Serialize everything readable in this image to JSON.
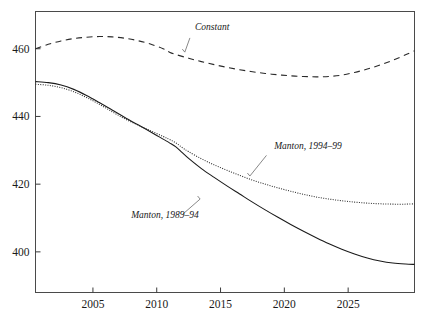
{
  "figure": {
    "top_fragment_text": "",
    "background_color": "#ffffff",
    "frame_color": "#4a4a4a"
  },
  "chart_data": {
    "type": "line",
    "title": "",
    "subtitle": "",
    "xlabel": "",
    "ylabel": "",
    "xlim": [
      2000.5,
      2030.2
    ],
    "ylim": [
      388,
      471
    ],
    "grid": false,
    "legend_position": "inline-annotations",
    "x_ticks": [
      2005,
      2010,
      2015,
      2020,
      2025
    ],
    "x_tick_labels": [
      "2005",
      "2010",
      "2015",
      "2020",
      "2025"
    ],
    "y_ticks": [
      400,
      420,
      440,
      460
    ],
    "y_tick_labels": [
      "400",
      "420",
      "440",
      "460"
    ],
    "series": [
      {
        "name": "Constant",
        "style": "dashed",
        "color": "#2a2a2a",
        "label": "Constant",
        "label_x": 2013.0,
        "label_y": 465.5,
        "leader_from": [
          2012.6,
          463.2
        ],
        "leader_to": [
          2012.2,
          459.0
        ],
        "x": [
          2000.5,
          2001.5,
          2002.5,
          2003.5,
          2004.5,
          2005.5,
          2006.5,
          2007.5,
          2008.5,
          2009.5,
          2010.5,
          2011.0,
          2011.5,
          2012.5,
          2013.5,
          2014.5,
          2015.5,
          2016.5,
          2017.5,
          2018.5,
          2019.5,
          2020.5,
          2021.5,
          2022.5,
          2023.5,
          2024.5,
          2025.5,
          2026.5,
          2027.5,
          2028.5,
          2029.5,
          2030.2
        ],
        "y": [
          460.0,
          461.3,
          462.3,
          463.0,
          463.4,
          463.6,
          463.5,
          463.1,
          462.4,
          461.4,
          460.0,
          459.0,
          458.3,
          457.2,
          456.2,
          455.3,
          454.5,
          453.8,
          453.2,
          452.7,
          452.3,
          452.0,
          451.8,
          451.7,
          451.8,
          452.2,
          453.0,
          454.0,
          455.2,
          456.6,
          458.2,
          459.4
        ]
      },
      {
        "name": "Manton, 1994-99",
        "style": "dotted",
        "color": "#2a2a2a",
        "label": "Manton, 1994–99",
        "label_x": 2019.2,
        "label_y": 430.5,
        "leader_from": [
          2018.6,
          428.5
        ],
        "leader_to": [
          2017.3,
          422.4
        ],
        "x": [
          2000.5,
          2001.5,
          2002.5,
          2003.5,
          2004.5,
          2005.5,
          2006.5,
          2007.5,
          2008.5,
          2009.5,
          2010.5,
          2011.0,
          2011.5,
          2012.0,
          2012.5,
          2013.5,
          2014.5,
          2015.5,
          2016.5,
          2017.5,
          2018.5,
          2019.5,
          2020.5,
          2021.5,
          2022.5,
          2023.5,
          2024.5,
          2025.5,
          2026.5,
          2027.5,
          2028.5,
          2029.5,
          2030.2
        ],
        "y": [
          449.5,
          449.2,
          448.5,
          447.3,
          445.6,
          443.6,
          441.4,
          439.3,
          437.5,
          435.8,
          434.1,
          433.2,
          432.2,
          430.8,
          429.6,
          427.5,
          425.7,
          424.1,
          422.6,
          421.2,
          420.0,
          418.9,
          417.9,
          417.0,
          416.2,
          415.6,
          415.1,
          414.7,
          414.4,
          414.2,
          414.1,
          414.1,
          414.2
        ]
      },
      {
        "name": "Manton, 1989-94",
        "style": "solid",
        "color": "#1a1a1a",
        "label": "Manton, 1989–94",
        "label_x": 2008.0,
        "label_y": 410.0,
        "leader_from": [
          2012.0,
          411.0
        ],
        "leader_to": [
          2013.4,
          415.6
        ],
        "x": [
          2000.5,
          2001.5,
          2002.5,
          2003.5,
          2004.5,
          2005.5,
          2006.5,
          2007.5,
          2008.5,
          2009.5,
          2010.5,
          2011.0,
          2011.5,
          2012.0,
          2012.5,
          2013.5,
          2014.5,
          2015.5,
          2016.5,
          2017.5,
          2018.5,
          2019.5,
          2020.5,
          2021.5,
          2022.5,
          2023.5,
          2024.5,
          2025.5,
          2026.5,
          2027.5,
          2028.5,
          2029.5,
          2030.2
        ],
        "y": [
          450.3,
          450.0,
          449.3,
          448.0,
          446.2,
          444.1,
          441.9,
          439.7,
          437.6,
          435.5,
          433.3,
          432.2,
          431.0,
          429.3,
          427.6,
          424.6,
          422.0,
          419.5,
          417.1,
          414.7,
          412.4,
          410.2,
          408.1,
          406.1,
          404.2,
          402.4,
          400.8,
          399.4,
          398.2,
          397.3,
          396.7,
          396.4,
          396.3
        ]
      }
    ]
  }
}
